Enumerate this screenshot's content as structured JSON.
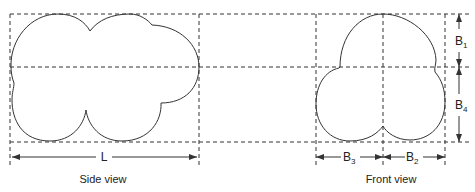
{
  "diagram": {
    "side_view": {
      "caption": "Side view",
      "dimension_label": "L"
    },
    "front_view": {
      "caption": "Front view",
      "dimensions": [
        {
          "base": "B",
          "sub": "1"
        },
        {
          "base": "B",
          "sub": "4"
        },
        {
          "base": "B",
          "sub": "3"
        },
        {
          "base": "B",
          "sub": "2"
        }
      ]
    },
    "colors": {
      "line": "#333333",
      "background": "#ffffff"
    }
  }
}
